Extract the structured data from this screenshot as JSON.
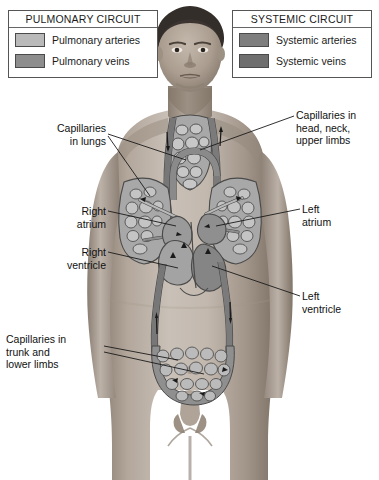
{
  "diagram": {
    "colors": {
      "pulmonary_artery": "#b9b9b9",
      "pulmonary_vein": "#8d8d8d",
      "systemic_artery": "#7e7e7e",
      "systemic_vein": "#6f6f6f",
      "vessel_outline": "#4a4a4a",
      "skin_light": "#c9bfb6",
      "skin_mid": "#a99a8d",
      "skin_dark": "#7e7266",
      "hair": "#3b3430",
      "background": "#ffffff",
      "text": "#111111",
      "legend_border": "#555555"
    }
  },
  "legends": [
    {
      "id": "pulmonary",
      "title": "PULMONARY CIRCUIT",
      "rows": [
        {
          "label": "Pulmonary arteries",
          "swatch": "#b9b9b9"
        },
        {
          "label": "Pulmonary veins",
          "swatch": "#8d8d8d"
        }
      ]
    },
    {
      "id": "systemic",
      "title": "SYSTEMIC CIRCUIT",
      "rows": [
        {
          "label": "Systemic arteries",
          "swatch": "#7e7e7e"
        },
        {
          "label": "Systemic veins",
          "swatch": "#6f6f6f"
        }
      ]
    }
  ],
  "callouts": {
    "capillaries_lungs": "Capillaries\nin lungs",
    "right_atrium": "Right\natrium",
    "right_ventricle": "Right\nventricle",
    "capillaries_trunk": "Capillaries in\ntrunk and\nlower limbs",
    "capillaries_head": "Capillaries in\nhead, neck,\nupper limbs",
    "left_atrium": "Left\natrium",
    "left_ventricle": "Left\nventricle"
  }
}
